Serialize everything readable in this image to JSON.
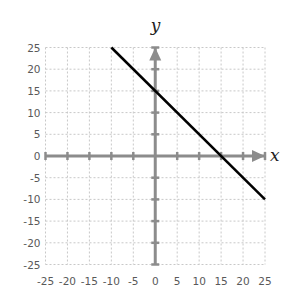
{
  "chart_data": {
    "type": "line",
    "title": "",
    "xlabel": "x",
    "ylabel": "y",
    "xlim": [
      -25,
      25
    ],
    "ylim": [
      -25,
      25
    ],
    "grid": true,
    "x_ticks": [
      -25,
      -20,
      -15,
      -10,
      -5,
      0,
      5,
      10,
      15,
      20,
      25
    ],
    "y_ticks": [
      25,
      20,
      15,
      10,
      5,
      0,
      -5,
      -10,
      -15,
      -20,
      -25
    ],
    "series": [
      {
        "name": "y = -x + 15",
        "x": [
          -10,
          25
        ],
        "y": [
          25,
          -10
        ],
        "color": "#000000"
      }
    ],
    "annotations": {
      "y_intercept": [
        0,
        15
      ],
      "x_intercept": [
        15,
        0
      ]
    }
  },
  "colors": {
    "grid": "#c8c8c8",
    "axis": "#8c8c8c",
    "line": "#000000",
    "tick_label": "#595959"
  }
}
